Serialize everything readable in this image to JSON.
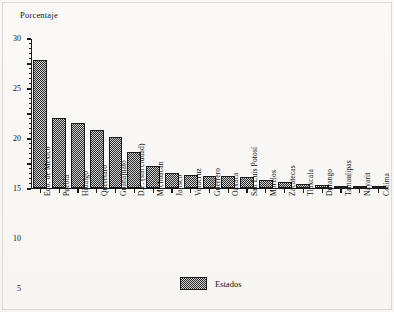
{
  "chart_data": {
    "type": "bar",
    "title": "",
    "ylabel": "Porcentaje",
    "xlabel": "",
    "ylim": [
      0,
      30
    ],
    "yticks": [
      0,
      5,
      10,
      15,
      20,
      25,
      30
    ],
    "ytick_labels": [
      "0",
      "5",
      "10",
      "15",
      "20",
      "25",
      "30"
    ],
    "grid": false,
    "legend": {
      "position": "bottom-center",
      "entries": [
        {
          "label": "Estados",
          "swatch": "hatched-gray"
        }
      ]
    },
    "categories": [
      "Edo. de México",
      "Puebla",
      "Hidalgo",
      "Querétaro",
      "Guanajuato",
      "D.F. (sin ciudad)",
      "Michoacán",
      "Jalisco",
      "Veracruz",
      "Guerrero",
      "Oaxaca",
      "San Luis Potosí",
      "Morelos",
      "Zacatecas",
      "Tlaxcala",
      "Durango",
      "Tamaulipas",
      "Nayarit",
      "Colima"
    ],
    "values": [
      25.6,
      14.0,
      13.0,
      11.6,
      10.1,
      7.2,
      4.3,
      3.0,
      2.6,
      2.4,
      2.3,
      2.1,
      1.5,
      1.2,
      0.7,
      0.5,
      0.4,
      0.3,
      0.2
    ],
    "series": [
      {
        "name": "Estados",
        "values": [
          25.6,
          14.0,
          13.0,
          11.6,
          10.1,
          7.2,
          4.3,
          3.0,
          2.6,
          2.4,
          2.3,
          2.1,
          1.5,
          1.2,
          0.7,
          0.5,
          0.4,
          0.3,
          0.2
        ]
      }
    ]
  },
  "colors": {
    "bar_fill": "#8d8d8d",
    "bar_edge": "#1b1b1b",
    "axis": "#1a1a1a",
    "background": "#f7f6f4",
    "text": "#111111"
  }
}
